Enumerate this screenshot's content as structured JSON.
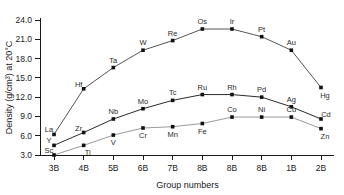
{
  "chart_data": {
    "type": "line",
    "title": "",
    "xlabel": "Group numbers",
    "ylabel": "Density (g/cm³) at 20°C",
    "categories": [
      "3B",
      "4B",
      "5B",
      "6B",
      "7B",
      "8B",
      "8B",
      "8B",
      "1B",
      "2B"
    ],
    "xlim": [
      0,
      9
    ],
    "ylim": [
      3.0,
      24.0
    ],
    "yticks": [
      "3.0",
      "6.0",
      "9.0",
      "12.0",
      "15.0",
      "18.0",
      "21.0",
      "24.0"
    ],
    "ytick_values": [
      3.0,
      6.0,
      9.0,
      12.0,
      15.0,
      18.0,
      21.0,
      24.0
    ],
    "grid": false,
    "legend": "none",
    "series": [
      {
        "name": "5d series",
        "color": "#555555",
        "point_labels": [
          "La",
          "Hf",
          "Ta",
          "W",
          "Re",
          "Os",
          "Ir",
          "Pt",
          "Au",
          "Hg"
        ],
        "values": [
          6.2,
          13.3,
          16.6,
          19.3,
          20.8,
          22.6,
          22.6,
          21.4,
          19.3,
          13.5
        ],
        "label_positions": [
          "above-left",
          "above-left",
          "above",
          "above",
          "above",
          "above",
          "above",
          "above",
          "above",
          "below-right"
        ]
      },
      {
        "name": "4d series",
        "color": "#2b2b2b",
        "point_labels": [
          "Y",
          "Zr",
          "Nb",
          "Mo",
          "Tc",
          "Ru",
          "Rh",
          "Pd",
          "Ag",
          "Cd"
        ],
        "values": [
          4.5,
          6.5,
          8.6,
          10.2,
          11.5,
          12.4,
          12.4,
          12.0,
          10.5,
          8.6
        ],
        "label_positions": [
          "above-left",
          "above-left",
          "above",
          "above",
          "above",
          "above",
          "above",
          "above",
          "above",
          "above-right"
        ]
      },
      {
        "name": "3d series",
        "color": "#9a9a9a",
        "point_labels": [
          "Sc",
          "Ti",
          "V",
          "Cr",
          "Mn",
          "Fe",
          "Co",
          "Ni",
          "Cu",
          "Zn"
        ],
        "values": [
          3.0,
          4.5,
          6.1,
          7.2,
          7.4,
          7.9,
          8.9,
          8.9,
          8.9,
          7.1
        ],
        "label_positions": [
          "above-left",
          "below-right",
          "below",
          "below",
          "below",
          "below",
          "above",
          "above",
          "above",
          "below-right"
        ]
      }
    ]
  }
}
